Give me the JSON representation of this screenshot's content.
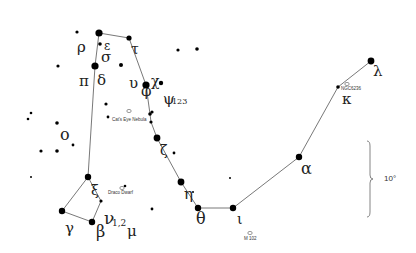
{
  "constellation": "Draco",
  "scale_label": "10°",
  "stars": [
    {
      "id": "top",
      "name": "",
      "x": 99,
      "y": 33,
      "r": 3.6
    },
    {
      "id": "epsilon",
      "name": "ε",
      "x": 100,
      "y": 44,
      "r": 1.8
    },
    {
      "id": "delta",
      "name": "δ",
      "x": 95,
      "y": 66,
      "r": 3.6
    },
    {
      "id": "tau",
      "name": "τ",
      "x": 129,
      "y": 38,
      "r": 2.6
    },
    {
      "id": "chi",
      "name": "χ",
      "x": 146,
      "y": 85,
      "r": 3.6
    },
    {
      "id": "psi",
      "name": "ψ",
      "x": 161,
      "y": 83,
      "r": 2.2
    },
    {
      "id": "omega1",
      "name": "",
      "x": 150,
      "y": 114,
      "r": 1.8
    },
    {
      "id": "omega",
      "name": "ω",
      "x": 151,
      "y": 122,
      "r": 1.6
    },
    {
      "id": "zeta",
      "name": "ζ",
      "x": 157,
      "y": 138,
      "r": 3.4
    },
    {
      "id": "eta",
      "name": "η",
      "x": 181,
      "y": 182,
      "r": 3.4
    },
    {
      "id": "theta",
      "name": "θ",
      "x": 198,
      "y": 208,
      "r": 3.2
    },
    {
      "id": "iota",
      "name": "ι",
      "x": 233,
      "y": 208,
      "r": 3.2
    },
    {
      "id": "alpha",
      "name": "α",
      "x": 299,
      "y": 157,
      "r": 3.2
    },
    {
      "id": "kappa",
      "name": "κ",
      "x": 338,
      "y": 87,
      "r": 1.8
    },
    {
      "id": "lambda",
      "name": "λ",
      "x": 371,
      "y": 61,
      "r": 3.4
    },
    {
      "id": "xi",
      "name": "ξ",
      "x": 88,
      "y": 177,
      "r": 3.2
    },
    {
      "id": "nu",
      "name": "ν",
      "x": 101,
      "y": 201,
      "r": 1.6
    },
    {
      "id": "gamma",
      "name": "γ",
      "x": 62,
      "y": 211,
      "r": 3.2
    },
    {
      "id": "beta",
      "name": "β",
      "x": 92,
      "y": 222,
      "r": 3.2
    }
  ],
  "field_stars": [
    [
      77,
      32,
      1.6
    ],
    [
      121,
      65,
      2.0
    ],
    [
      178,
      50,
      1.6
    ],
    [
      106,
      104,
      1.6
    ],
    [
      152,
      112,
      1.6
    ],
    [
      58,
      66,
      1.6
    ],
    [
      31,
      113,
      1.3
    ],
    [
      28,
      119,
      1.3
    ],
    [
      57,
      123,
      1.8
    ],
    [
      41,
      151,
      1.6
    ],
    [
      57,
      151,
      1.8
    ],
    [
      73,
      145,
      1.4
    ],
    [
      31,
      177,
      1.0
    ],
    [
      174,
      153,
      1.4
    ],
    [
      193,
      192,
      1.0
    ],
    [
      152,
      209,
      1.4
    ],
    [
      125,
      186,
      1.3
    ],
    [
      197,
      49,
      1.8
    ],
    [
      230,
      178,
      1.0
    ],
    [
      108,
      117,
      1.4
    ]
  ],
  "lines": [
    [
      "top",
      "tau",
      "chi",
      "omega1",
      "omega",
      "zeta",
      "eta",
      "theta",
      "iota",
      "alpha",
      "kappa",
      "lambda"
    ],
    [
      "top",
      "delta",
      "xi",
      "nu",
      "beta",
      "gamma",
      "xi"
    ]
  ],
  "labels": [
    {
      "text": "ρ",
      "x": 77,
      "y": 52,
      "size": 15
    },
    {
      "text": "ε",
      "x": 104,
      "y": 50,
      "size": 12
    },
    {
      "text": "σ",
      "x": 101,
      "y": 62,
      "size": 15
    },
    {
      "text": "τ",
      "x": 131,
      "y": 54,
      "size": 14
    },
    {
      "text": "π",
      "x": 79,
      "y": 86,
      "size": 15
    },
    {
      "text": "δ",
      "x": 97,
      "y": 85,
      "size": 15
    },
    {
      "text": "υ",
      "x": 129,
      "y": 88,
      "size": 15
    },
    {
      "text": "φ",
      "x": 141,
      "y": 96,
      "size": 15
    },
    {
      "text": "χ",
      "x": 151,
      "y": 86,
      "size": 14
    },
    {
      "text": "ψ",
      "x": 163,
      "y": 104,
      "size": 15
    },
    {
      "text": "ο",
      "x": 60,
      "y": 140,
      "size": 16
    },
    {
      "text": "ζ",
      "x": 160,
      "y": 155,
      "size": 14
    },
    {
      "text": "η",
      "x": 184,
      "y": 199,
      "size": 15
    },
    {
      "text": "θ",
      "x": 196,
      "y": 224,
      "size": 16
    },
    {
      "text": "ι",
      "x": 237,
      "y": 224,
      "size": 14
    },
    {
      "text": "α",
      "x": 301,
      "y": 174,
      "size": 16
    },
    {
      "text": "κ",
      "x": 342,
      "y": 104,
      "size": 15
    },
    {
      "text": "λ",
      "x": 373,
      "y": 76,
      "size": 15
    },
    {
      "text": "ξ",
      "x": 91,
      "y": 195,
      "size": 14
    },
    {
      "text": "ν",
      "x": 104,
      "y": 224,
      "size": 17
    },
    {
      "text": "γ",
      "x": 65,
      "y": 233,
      "size": 15
    },
    {
      "text": "β",
      "x": 96,
      "y": 237,
      "size": 16
    },
    {
      "text": "μ",
      "x": 127,
      "y": 236,
      "size": 15
    }
  ],
  "subscripts": [
    {
      "text": "123",
      "x": 172,
      "y": 104,
      "size": 8
    },
    {
      "text": "1,2",
      "x": 112,
      "y": 226,
      "size": 9
    }
  ],
  "deep_sky": [
    {
      "name": "Cat's Eye Nebula",
      "label_x": 112,
      "label_y": 121,
      "sym_x": 129,
      "sym_y": 111
    },
    {
      "name": "Draco Dwarf",
      "label_x": 108,
      "label_y": 194,
      "sym_x": 122,
      "sym_y": 188
    },
    {
      "name": "NGC6236",
      "label_x": 341,
      "label_y": 90,
      "sym_x": 347,
      "sym_y": 84
    },
    {
      "name": "M 102",
      "label_x": 244,
      "label_y": 240,
      "sym_x": 250,
      "sym_y": 233
    }
  ],
  "scale_bar": {
    "x": 370,
    "y1": 141,
    "y2": 217,
    "label_x": 384,
    "label_y": 181
  },
  "colors": {
    "star": "#000000",
    "line": "#555555",
    "text": "#222222",
    "background": "#ffffff"
  }
}
